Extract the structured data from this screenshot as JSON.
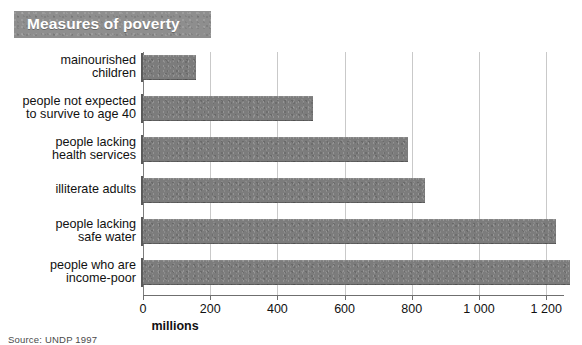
{
  "title": "Measures of poverty",
  "source_note": "Source: UNDP 1997",
  "chart_data": {
    "type": "bar",
    "orientation": "horizontal",
    "title": "Measures of poverty",
    "xlabel": "millions",
    "ylabel": "",
    "xlim": [
      0,
      1300
    ],
    "grid": true,
    "legend": "none",
    "tick_labels": [
      "0",
      "200",
      "400",
      "600",
      "800",
      "1 000",
      "1 200"
    ],
    "ticks": [
      0,
      200,
      400,
      600,
      800,
      1000,
      1200
    ],
    "categories": [
      "mainourished\nchildren",
      "people not expected\nto survive to age 40",
      "people lacking\nhealth services",
      "illiterate adults",
      "people lacking\nsafe water",
      "people who are\nincome-poor"
    ],
    "values": [
      158,
      507,
      790,
      840,
      1230,
      1270
    ],
    "bar_color": "#7c7c7c",
    "grid_color": "#c9c9c9",
    "axis_color": "#6f6f6f",
    "title_banner_color": "#8e8e8e",
    "title_text_color": "#ffffff"
  }
}
